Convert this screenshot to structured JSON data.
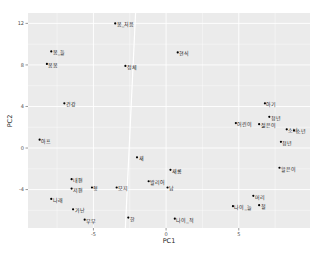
{
  "chart_data": {
    "type": "scatter",
    "title": "",
    "xlabel": "PC1",
    "ylabel": "PC2",
    "xlim": [
      -9.5,
      9.9
    ],
    "ylim": [
      -7.7,
      13.0
    ],
    "x_ticks": [
      -5,
      0,
      5
    ],
    "y_ticks": [
      -4,
      0,
      4,
      8,
      12
    ],
    "grid": true,
    "legend": null,
    "panel_background": "#ebebeb",
    "grid_color": "#ffffff",
    "point_color": "#000000",
    "reference_line": {
      "x1": -2.1,
      "y1": 13.0,
      "x2": -2.8,
      "y2": -7.7,
      "color": "#ffffff"
    },
    "points": [
      {
        "label": "봄_처음",
        "x": -3.5,
        "y": 12.0
      },
      {
        "label": "봄_들",
        "x": -7.9,
        "y": 9.3
      },
      {
        "label": "봄봄",
        "x": -8.2,
        "y": 8.1
      },
      {
        "label": "정체",
        "x": -2.8,
        "y": 7.9
      },
      {
        "label": "현식",
        "x": 0.8,
        "y": 9.2
      },
      {
        "label": "건강",
        "x": -7.0,
        "y": 4.3
      },
      {
        "label": "아프",
        "x": -8.7,
        "y": 0.8
      },
      {
        "label": "새",
        "x": -2.0,
        "y": -0.9
      },
      {
        "label": "내편",
        "x": -6.5,
        "y": -3.0
      },
      {
        "label": "저편",
        "x": -6.5,
        "y": -3.9
      },
      {
        "label": "형",
        "x": -5.1,
        "y": -3.8
      },
      {
        "label": "모지",
        "x": -3.4,
        "y": -3.8
      },
      {
        "label": "나래",
        "x": -7.9,
        "y": -4.9
      },
      {
        "label": "가난",
        "x": -6.4,
        "y": -5.9
      },
      {
        "label": "부부",
        "x": -5.6,
        "y": -6.9
      },
      {
        "label": "한",
        "x": -2.6,
        "y": -6.7
      },
      {
        "label": "새롬",
        "x": 0.3,
        "y": -2.1
      },
      {
        "label": "발리어",
        "x": -1.2,
        "y": -3.2
      },
      {
        "label": "남",
        "x": 0.1,
        "y": -3.8
      },
      {
        "label": "나이_적",
        "x": 0.6,
        "y": -6.8
      },
      {
        "label": "아기",
        "x": 6.8,
        "y": 4.3
      },
      {
        "label": "어린이",
        "x": 4.8,
        "y": 2.4
      },
      {
        "label": "젊은이",
        "x": 6.4,
        "y": 2.3
      },
      {
        "label": "청년",
        "x": 7.1,
        "y": 3.0
      },
      {
        "label": "소녀",
        "x": 8.3,
        "y": 1.8
      },
      {
        "label": "소년",
        "x": 8.8,
        "y": 1.7
      },
      {
        "label": "청년",
        "x": 7.9,
        "y": 0.6
      },
      {
        "label": "할은이",
        "x": 7.8,
        "y": -1.9
      },
      {
        "label": "머리",
        "x": 6.0,
        "y": -4.6
      },
      {
        "label": "나이_늘",
        "x": 4.6,
        "y": -5.6
      },
      {
        "label": "철",
        "x": 6.4,
        "y": -5.5
      }
    ]
  }
}
